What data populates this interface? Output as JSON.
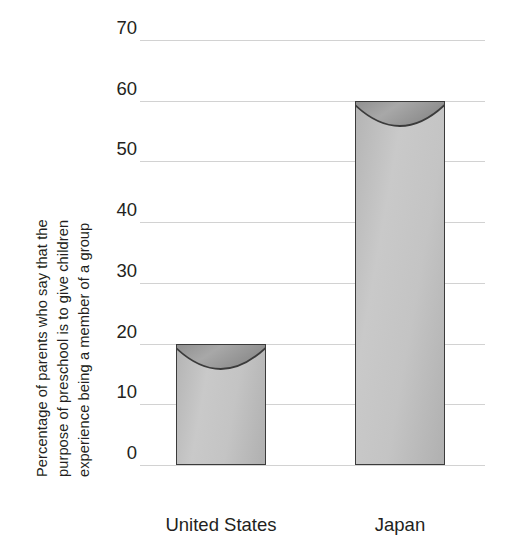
{
  "chart_data": {
    "type": "bar",
    "title": "",
    "ylabel": "Percentage of parents who say that the purpose of preschool is to give children experience being a member of a group",
    "ylabel_lines": [
      "Percentage of parents who say that the",
      "purpose of preschool is to give children",
      "experience being a member of a group"
    ],
    "xlabel": "",
    "categories": [
      "United States",
      "Japan"
    ],
    "values": [
      20,
      60
    ],
    "ylim": [
      0,
      70
    ],
    "ytick_values": [
      70,
      60,
      50,
      40,
      30,
      20,
      10,
      0
    ],
    "ytick_labels": [
      "70",
      "60",
      "50",
      "40",
      "30",
      "20",
      "10",
      "0"
    ],
    "grid": "horizontal",
    "legend": "none",
    "bar_style": "gray-gradient-with-concave-arc-top",
    "colors": {
      "bar_fill_light": "#c9c9c9",
      "bar_fill_dark": "#9a9a9a",
      "bar_outline": "#3b3b3b",
      "gridline": "#d2d2d2",
      "text": "#231f20",
      "background": "#ffffff"
    }
  }
}
